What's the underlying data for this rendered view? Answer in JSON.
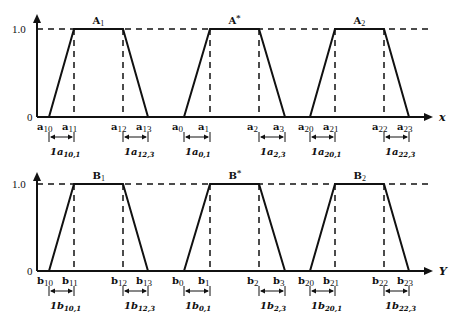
{
  "panels": [
    {
      "id": "top",
      "axis_label": "x",
      "y_ticks": [
        "1.0",
        "0"
      ],
      "trapezoids": [
        {
          "name": "A",
          "name_sub": "1",
          "points": [
            {
              "base": "a",
              "sub": "10"
            },
            {
              "base": "a",
              "sub": "11"
            },
            {
              "base": "a",
              "sub": "12"
            },
            {
              "base": "a",
              "sub": "13"
            }
          ],
          "widths": [
            {
              "base": "1a",
              "sub": "10,1"
            },
            {
              "base": "1a",
              "sub": "12,3"
            }
          ]
        },
        {
          "name": "A",
          "name_sup": "*",
          "points": [
            {
              "base": "a",
              "sub": "0"
            },
            {
              "base": "a",
              "sub": "1"
            },
            {
              "base": "a",
              "sub": "2"
            },
            {
              "base": "a",
              "sub": "3"
            }
          ],
          "widths": [
            {
              "base": "1a",
              "sub": "0,1"
            },
            {
              "base": "1a",
              "sub": "2,3"
            }
          ]
        },
        {
          "name": "A",
          "name_sub": "2",
          "points": [
            {
              "base": "a",
              "sub": "20"
            },
            {
              "base": "a",
              "sub": "21"
            },
            {
              "base": "a",
              "sub": "22"
            },
            {
              "base": "a",
              "sub": "23"
            }
          ],
          "widths": [
            {
              "base": "1a",
              "sub": "20,1"
            },
            {
              "base": "1a",
              "sub": "22,3"
            }
          ]
        }
      ]
    },
    {
      "id": "bottom",
      "axis_label": "Y",
      "y_ticks": [
        "1.0",
        "0"
      ],
      "trapezoids": [
        {
          "name": "B",
          "name_sub": "1",
          "points": [
            {
              "base": "b",
              "sub": "10"
            },
            {
              "base": "b",
              "sub": "11"
            },
            {
              "base": "b",
              "sub": "12"
            },
            {
              "base": "b",
              "sub": "13"
            }
          ],
          "widths": [
            {
              "base": "1b",
              "sub": "10,1"
            },
            {
              "base": "1b",
              "sub": "12,3"
            }
          ]
        },
        {
          "name": "B",
          "name_sup": "*",
          "points": [
            {
              "base": "b",
              "sub": "0"
            },
            {
              "base": "b",
              "sub": "1"
            },
            {
              "base": "b",
              "sub": "2"
            },
            {
              "base": "b",
              "sub": "3"
            }
          ],
          "widths": [
            {
              "base": "1b",
              "sub": "0,1"
            },
            {
              "base": "1b",
              "sub": "2,3"
            }
          ]
        },
        {
          "name": "B",
          "name_sub": "2",
          "points": [
            {
              "base": "b",
              "sub": "20"
            },
            {
              "base": "b",
              "sub": "21"
            },
            {
              "base": "b",
              "sub": "22"
            },
            {
              "base": "b",
              "sub": "23"
            }
          ],
          "widths": [
            {
              "base": "1b",
              "sub": "20,1"
            },
            {
              "base": "1b",
              "sub": "22,3"
            }
          ]
        }
      ]
    }
  ]
}
